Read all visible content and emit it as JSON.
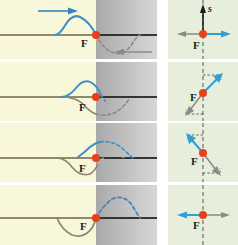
{
  "figure": {
    "boundary_label": "F",
    "axis_label": "s",
    "frame_count": 4
  },
  "colors": {
    "incident_blue": "#3d8fc4",
    "reflected_gray": "#7e7a66",
    "dot_red": "#e8401a",
    "string_line": "#6b6648",
    "medium_light": "#f9f7d9",
    "medium_dense": "#bdbdbd",
    "vector_panel_bg": "#e7efdc",
    "axis_dark": "#1d1d1d",
    "label_dark": "#1d1d1d"
  },
  "rows": [
    {
      "index": 1,
      "left": {
        "boundary_label": "F",
        "incident_pulse": "solid-blue-crest-left-of-boundary",
        "incident_arrow": "arrow-right-blue",
        "reflected_pulse": "dashed-gray-trough-right-of-boundary",
        "reflected_arrow": "arrow-left-gray"
      },
      "right": {
        "boundary_label": "F",
        "axis_label": "s",
        "axis_arrow": "arrow-up-dark",
        "blue_vector": "arrow-right",
        "gray_vector": "arrow-left"
      }
    },
    {
      "index": 2,
      "left": {
        "boundary_label": "F",
        "incident_pulse": "solid-blue-crest-at-boundary",
        "reflected_pulse": "solid-gray-trough-at-boundary",
        "ghost_pulse": "dashed-gray-trough-right-of-boundary"
      },
      "right": {
        "boundary_label": "F",
        "blue_vector": "arrow-up-right",
        "gray_vector": "arrow-down-left"
      }
    },
    {
      "index": 3,
      "left": {
        "boundary_label": "F",
        "incident_pulse": "dashed-blue-crest-right-of-boundary",
        "reflected_pulse": "solid-gray-trough-left-of-boundary"
      },
      "right": {
        "boundary_label": "F",
        "blue_vector": "arrow-up-left",
        "gray_vector": "arrow-down-right"
      }
    },
    {
      "index": 4,
      "left": {
        "boundary_label": "F",
        "transmitted_pulse": "dashed-blue-crest-right-of-boundary",
        "reflected_pulse": "solid-gray-trough-left-of-boundary"
      },
      "right": {
        "boundary_label": "F",
        "blue_vector": "arrow-left",
        "gray_vector": "arrow-right"
      }
    }
  ]
}
